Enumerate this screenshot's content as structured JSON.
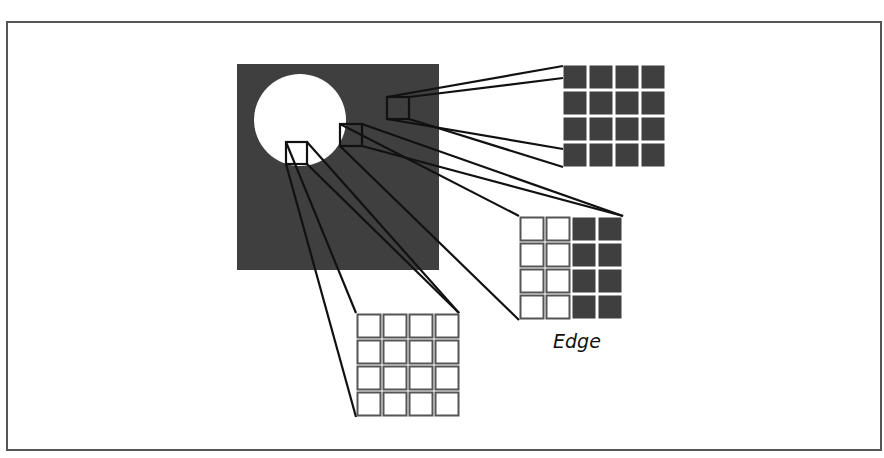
{
  "diagram": {
    "image": {
      "background_color": "#3f3f3f",
      "foreground_color": "#ffffff"
    },
    "zoom_regions": [
      {
        "name": "dark-region",
        "grid": "4x4",
        "fill": "all-dark"
      },
      {
        "name": "edge-region",
        "grid": "4x4",
        "fill": "half-light-half-dark",
        "label": "Edge"
      },
      {
        "name": "light-region",
        "grid": "4x4",
        "fill": "all-light"
      }
    ],
    "labels": {
      "edge": "Edge"
    },
    "colors": {
      "dark": "#3f3f3f",
      "light": "#ffffff",
      "line": "#111111",
      "cell_border": "#555555",
      "frame": "#555555"
    }
  }
}
